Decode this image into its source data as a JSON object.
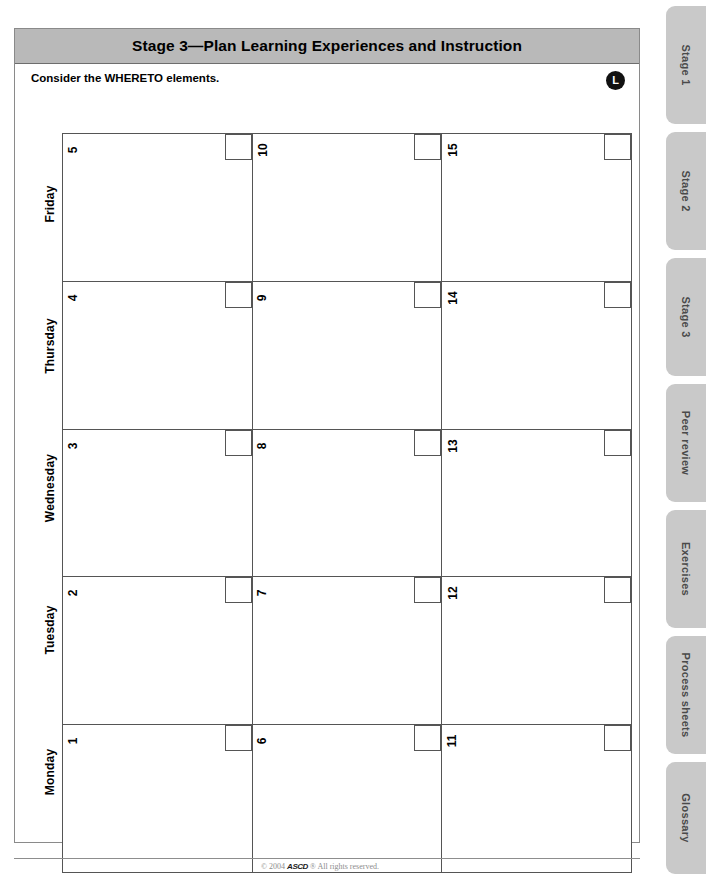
{
  "header": {
    "title": "Stage 3—Plan Learning Experiences and Instruction"
  },
  "prompt": {
    "text": "Consider the WHERETO elements.",
    "badge": "L"
  },
  "calendar": {
    "days": [
      "Friday",
      "Thursday",
      "Wednesday",
      "Tuesday",
      "Monday"
    ],
    "rows": [
      {
        "day": "Friday",
        "cells": [
          "5",
          "10",
          "15"
        ]
      },
      {
        "day": "Thursday",
        "cells": [
          "4",
          "9",
          "14"
        ]
      },
      {
        "day": "Wednesday",
        "cells": [
          "3",
          "8",
          "13"
        ]
      },
      {
        "day": "Tuesday",
        "cells": [
          "2",
          "7",
          "12"
        ]
      },
      {
        "day": "Monday",
        "cells": [
          "1",
          "6",
          "11"
        ]
      }
    ]
  },
  "footer": {
    "copyright_prefix": "© 2004",
    "mark": "ASCD",
    "copyright_suffix": "® All rights reserved.",
    "page_number": "51"
  },
  "tab_rail": {
    "tabs": [
      {
        "label": "Stage 1"
      },
      {
        "label": "Stage 2"
      },
      {
        "label": "Stage 3"
      },
      {
        "label": "Peer review"
      },
      {
        "label": "Exercises"
      },
      {
        "label": "Process sheets"
      },
      {
        "label": "Glossary"
      }
    ]
  },
  "colors": {
    "title_bar": "#b9b9b9",
    "tab": "#c9c9c9",
    "rule": "#555555",
    "badge": "#111111"
  }
}
